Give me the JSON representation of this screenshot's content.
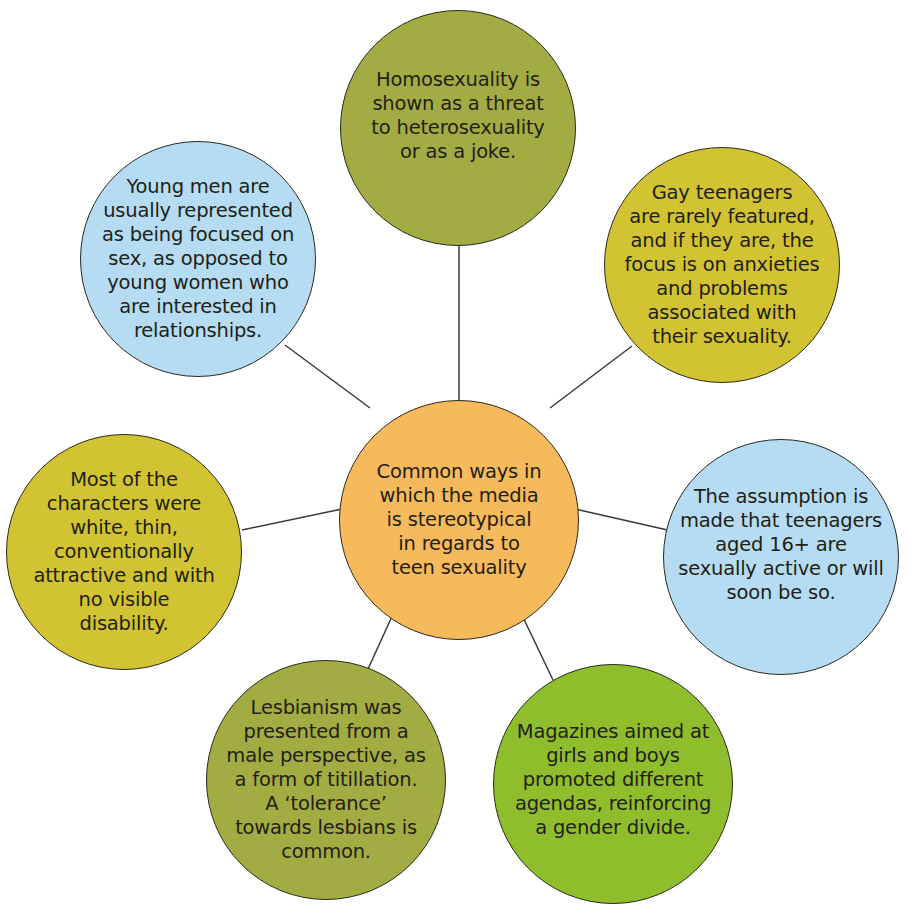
{
  "diagram": {
    "type": "mind-map",
    "hub": {
      "text": "Common ways in\nwhich the media\nis stereotypical\nin regards to\nteen sexuality",
      "color": "#f6b95c",
      "cx": 459,
      "cy": 520,
      "r": 120
    },
    "nodes": [
      {
        "id": "top",
        "text": "Homosexuality is\nshown as a threat\nto heterosexuality\nor as a joke.",
        "color": "#a3ab43",
        "cx": 458,
        "cy": 128,
        "r": 118,
        "text_dy": -12
      },
      {
        "id": "top-left",
        "text": "Young men are\nusually represented\nas being focused on\nsex, as opposed to\nyoung women who\nare interested in\nrelationships.",
        "color": "#b5dcf2",
        "cx": 198,
        "cy": 259,
        "r": 118,
        "text_dy": 0
      },
      {
        "id": "top-right",
        "text": "Gay teenagers\nare rarely featured,\nand if they are, the\nfocus is on anxieties\nand problems\nassociated with\ntheir sexuality.",
        "color": "#d2c332",
        "cx": 722,
        "cy": 265,
        "r": 118,
        "text_dy": 0
      },
      {
        "id": "left",
        "text": "Most of the\ncharacters were\nwhite, thin,\nconventionally\nattractive and with\nno visible\ndisability.",
        "color": "#d2c332",
        "cx": 124,
        "cy": 552,
        "r": 118,
        "text_dy": 0
      },
      {
        "id": "right",
        "text": "The assumption is\nmade that teenagers\naged 16+ are\nsexually active or will\nsoon be so.",
        "color": "#b5dcf2",
        "cx": 781,
        "cy": 557,
        "r": 118,
        "text_dy": -12
      },
      {
        "id": "bottom-left",
        "text": "Lesbianism was\npresented from a\nmale perspective, as\na form of titillation.\nA ‘tolerance’\ntowards lesbians is\ncommon.",
        "color": "#a3ab43",
        "cx": 326,
        "cy": 780,
        "r": 120,
        "text_dy": 0
      },
      {
        "id": "bottom-right",
        "text": "Magazines aimed at\ngirls and boys\npromoted different\nagendas, reinforcing\na gender divide.",
        "color": "#8fbe2d",
        "cx": 613,
        "cy": 784,
        "r": 120,
        "text_dy": -4
      }
    ],
    "connectors": [
      {
        "from": "hub",
        "to": "top",
        "x1": 459,
        "y1": 400,
        "x2": 459,
        "y2": 246
      },
      {
        "from": "hub",
        "to": "top-left",
        "x1": 370,
        "y1": 408,
        "x2": 285,
        "y2": 345
      },
      {
        "from": "hub",
        "to": "top-right",
        "x1": 550,
        "y1": 408,
        "x2": 632,
        "y2": 346
      },
      {
        "from": "hub",
        "to": "left",
        "x1": 342,
        "y1": 509,
        "x2": 242,
        "y2": 530
      },
      {
        "from": "hub",
        "to": "right",
        "x1": 575,
        "y1": 509,
        "x2": 672,
        "y2": 531
      },
      {
        "from": "hub",
        "to": "bottom-left",
        "x1": 404,
        "y1": 590,
        "x2": 363,
        "y2": 680
      },
      {
        "from": "hub",
        "to": "bottom-right",
        "x1": 510,
        "y1": 590,
        "x2": 553,
        "y2": 680
      }
    ],
    "line_color": "#3a3a3a",
    "border_color": "#2c2a1e"
  }
}
